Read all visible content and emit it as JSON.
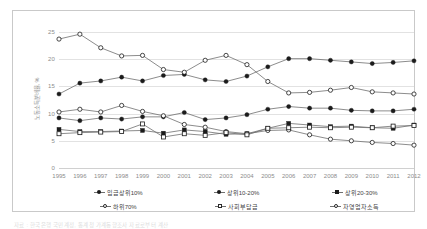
{
  "chart_data": {
    "type": "line",
    "title": "",
    "xlabel": "",
    "ylabel": "노동소득분배율, %",
    "ylim": [
      0,
      25
    ],
    "yticks": [
      0,
      5,
      10,
      15,
      20,
      25
    ],
    "grid": true,
    "legend_position": "bottom",
    "categories": [
      1995,
      1996,
      1997,
      1998,
      1999,
      2000,
      2001,
      2002,
      2003,
      2004,
      2005,
      2006,
      2007,
      2008,
      2009,
      2010,
      2011,
      2012
    ],
    "series": [
      {
        "name": "임금상위10%",
        "marker": "filled-diamond",
        "values": [
          13.6,
          15.6,
          16.0,
          16.7,
          16.0,
          17.0,
          17.2,
          16.2,
          15.9,
          16.9,
          18.6,
          20.1,
          20.1,
          19.8,
          19.5,
          19.2,
          19.4,
          19.7
        ]
      },
      {
        "name": "상위10-20%",
        "marker": "filled-circle",
        "values": [
          9.2,
          8.7,
          9.2,
          9.0,
          9.4,
          9.4,
          10.2,
          8.9,
          9.2,
          9.8,
          10.8,
          11.3,
          11.0,
          11.0,
          10.6,
          10.5,
          10.5,
          10.8
        ]
      },
      {
        "name": "상위20-30%",
        "marker": "filled-square",
        "values": [
          7.1,
          6.7,
          6.7,
          6.8,
          6.9,
          6.4,
          7.0,
          6.7,
          6.2,
          6.3,
          7.3,
          8.2,
          7.9,
          7.6,
          7.7,
          7.4,
          7.3,
          7.9
        ]
      },
      {
        "name": "하위70%",
        "marker": "open-circle",
        "values": [
          10.3,
          10.8,
          10.3,
          11.5,
          10.4,
          9.6,
          8.0,
          7.5,
          6.7,
          6.3,
          6.9,
          7.0,
          6.1,
          5.3,
          5.0,
          4.7,
          4.5,
          4.2
        ]
      },
      {
        "name": "사회부담금",
        "marker": "open-square",
        "values": [
          6.3,
          6.5,
          6.6,
          6.7,
          8.1,
          5.7,
          6.3,
          6.0,
          6.5,
          6.1,
          7.3,
          7.4,
          7.5,
          7.4,
          7.5,
          7.4,
          7.7,
          7.8
        ]
      },
      {
        "name": "자영업자소득",
        "marker": "open-circle",
        "values": [
          23.7,
          24.6,
          22.1,
          20.6,
          20.7,
          18.1,
          17.6,
          19.8,
          20.7,
          19.0,
          15.9,
          13.8,
          13.9,
          14.3,
          14.8,
          14.0,
          13.8,
          13.6
        ]
      }
    ]
  },
  "footnote": {
    "text": "자료 : 한국은행 국민계정, 통계청 가계동향조사 자료로부터 계산"
  },
  "colors": {
    "grid": "#e2e2e2",
    "frame": "#c9c9c9",
    "line": "#6f6f6f",
    "marker_dark": "#1b1b1b",
    "tick_text": "#8c8c8c"
  }
}
